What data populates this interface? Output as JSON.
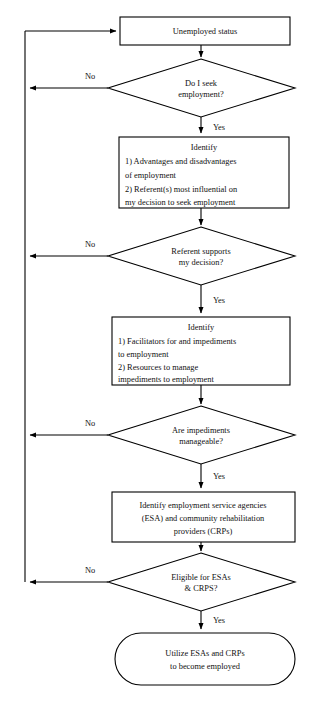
{
  "diagram": {
    "type": "flowchart",
    "colors": {
      "stroke": "#000000",
      "fill": "#ffffff",
      "text": "#111111",
      "background": "#ffffff"
    },
    "nodes": [
      {
        "id": "unemployed-status",
        "shape": "rectangle",
        "lines": [
          "Unemployed status"
        ],
        "align": "center"
      },
      {
        "id": "seek-employment-decision",
        "shape": "diamond",
        "lines": [
          "Do I seek",
          "employment?"
        ],
        "align": "center"
      },
      {
        "id": "identify-advantages-referents",
        "shape": "rectangle",
        "heading": "Identify",
        "lines": [
          "1) Advantages and disadvantages",
          "of employment",
          "2) Referent(s) most influential on",
          "my decision to seek employment"
        ],
        "align": "left"
      },
      {
        "id": "referent-supports-decision",
        "shape": "diamond",
        "lines": [
          "Referent supports",
          "my decision?"
        ],
        "align": "center"
      },
      {
        "id": "identify-facilitators-resources",
        "shape": "rectangle",
        "heading": "Identify",
        "lines": [
          "1) Facilitators for and impediments",
          "to employment",
          "2) Resources to manage",
          "impediments to employment"
        ],
        "align": "left"
      },
      {
        "id": "impediments-manageable",
        "shape": "diamond",
        "lines": [
          "Are impediments",
          "manageable?"
        ],
        "align": "center"
      },
      {
        "id": "identify-esa-crp",
        "shape": "rectangle",
        "lines": [
          "Identify employment service agencies",
          "(ESA) and community rehabilitation",
          "providers (CRPs)"
        ],
        "align": "center"
      },
      {
        "id": "eligible-for-esas-crps",
        "shape": "diamond",
        "lines": [
          "Eligible for ESAs",
          "& CRPS?"
        ],
        "align": "center"
      },
      {
        "id": "utilize-esas-crps",
        "shape": "stadium",
        "lines": [
          "Utilize ESAs and CRPs",
          "to become employed"
        ],
        "align": "center"
      }
    ],
    "edge_labels": {
      "no_1": "No",
      "yes_1": "Yes",
      "no_2": "No",
      "yes_2": "Yes",
      "no_3": "No",
      "yes_3": "Yes",
      "no_4": "No",
      "yes_4": "Yes"
    }
  }
}
